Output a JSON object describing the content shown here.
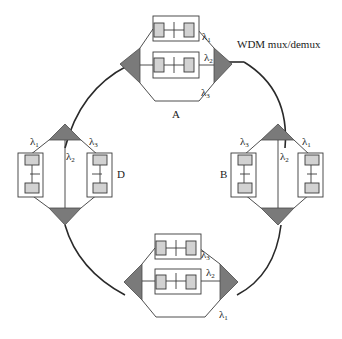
{
  "diagram": {
    "callout_label": "WDM mux/demux",
    "nodes": [
      {
        "id": "A",
        "label": "A",
        "position": "top",
        "wavelengths": [
          "λ1",
          "λ2",
          "λ3"
        ],
        "transceivers_on": [
          "λ1",
          "λ2"
        ],
        "passthrough": [
          "λ3"
        ]
      },
      {
        "id": "B",
        "label": "B",
        "position": "right",
        "wavelengths": [
          "λ3",
          "λ2",
          "λ1"
        ],
        "transceivers_on": [
          "λ3",
          "λ1"
        ],
        "passthrough": [
          "λ2"
        ]
      },
      {
        "id": "C",
        "label": "C",
        "position": "bottom",
        "wavelengths": [
          "λ3",
          "λ2",
          "λ1"
        ],
        "transceivers_on": [
          "λ3",
          "λ2"
        ],
        "passthrough": [
          "λ1"
        ]
      },
      {
        "id": "D",
        "label": "D",
        "position": "left",
        "wavelengths": [
          "λ1",
          "λ2",
          "λ3"
        ],
        "transceivers_on": [
          "λ1",
          "λ3"
        ],
        "passthrough": [
          "λ2"
        ]
      }
    ],
    "lambda_symbol": "λ",
    "subscripts": [
      "1",
      "2",
      "3"
    ],
    "colors": {
      "multiplexer_fill": "#7a7a7a",
      "transceiver_pad_fill": "#d2d2d2",
      "line": "#2a2a2a",
      "background": "#ffffff"
    }
  }
}
